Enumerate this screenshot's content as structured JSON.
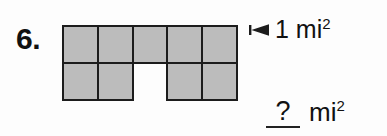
{
  "problem": {
    "number_label": "6.",
    "type": "area-of-composite-figure"
  },
  "figure": {
    "name": "unit-square-grid",
    "columns": 5,
    "rows": 2,
    "fill_color": "#bcbcbc",
    "stroke_color": "#1c1c1c",
    "background_color": "#fdfdfd",
    "cells": [
      {
        "row": 0,
        "col": 0,
        "filled": true
      },
      {
        "row": 0,
        "col": 1,
        "filled": true
      },
      {
        "row": 0,
        "col": 2,
        "filled": true
      },
      {
        "row": 0,
        "col": 3,
        "filled": true
      },
      {
        "row": 0,
        "col": 4,
        "filled": true
      },
      {
        "row": 1,
        "col": 0,
        "filled": true
      },
      {
        "row": 1,
        "col": 1,
        "filled": true
      },
      {
        "row": 1,
        "col": 2,
        "filled": false
      },
      {
        "row": 1,
        "col": 3,
        "filled": true
      },
      {
        "row": 1,
        "col": 4,
        "filled": true
      }
    ]
  },
  "callout": {
    "arrow_icon": "arrow-left-icon",
    "value": "1",
    "unit": "mi",
    "exponent": "2",
    "full_text": "1 mi2"
  },
  "answer": {
    "blank_value": "?",
    "unit": "mi",
    "exponent": "2",
    "full_text": "? mi2"
  }
}
